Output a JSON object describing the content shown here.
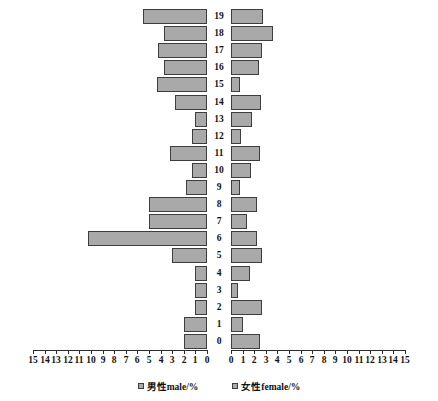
{
  "chart_data": {
    "type": "bar",
    "subtype": "population-pyramid",
    "title": "",
    "xlabel": "",
    "ylabel": "",
    "orientation": "horizontal",
    "grid": false,
    "legend_position": "bottom",
    "categories": [
      "0",
      "1",
      "2",
      "3",
      "4",
      "5",
      "6",
      "7",
      "8",
      "9",
      "10",
      "11",
      "12",
      "13",
      "14",
      "15",
      "16",
      "17",
      "18",
      "19"
    ],
    "xlim_left": [
      0,
      15
    ],
    "xlim_right": [
      0,
      15
    ],
    "xticks_left": [
      "15",
      "14",
      "13",
      "12",
      "11",
      "10",
      "9",
      "8",
      "7",
      "6",
      "5",
      "4",
      "3",
      "2",
      "1",
      "0"
    ],
    "xticks_right": [
      "0",
      "1",
      "2",
      "3",
      "4",
      "5",
      "6",
      "7",
      "8",
      "9",
      "10",
      "11",
      "12",
      "13",
      "14",
      "15"
    ],
    "series": [
      {
        "name": "男性male/%",
        "side": "left",
        "color": "#a9a9a9",
        "values": [
          2.0,
          2.0,
          1.0,
          1.0,
          1.0,
          3.0,
          10.3,
          5.0,
          5.0,
          1.8,
          1.3,
          3.2,
          1.3,
          1.0,
          2.8,
          4.3,
          3.7,
          4.2,
          3.7,
          5.5
        ]
      },
      {
        "name": "女性female/%",
        "side": "right",
        "color": "#a9a9a9",
        "values": [
          2.5,
          1.0,
          2.7,
          0.6,
          1.6,
          2.7,
          2.2,
          1.4,
          2.2,
          0.8,
          1.7,
          2.5,
          0.9,
          1.8,
          2.6,
          0.8,
          2.4,
          2.7,
          3.6,
          2.8
        ]
      }
    ]
  },
  "legend": {
    "male_label": "男性male/%",
    "female_label": "女性female/%"
  }
}
